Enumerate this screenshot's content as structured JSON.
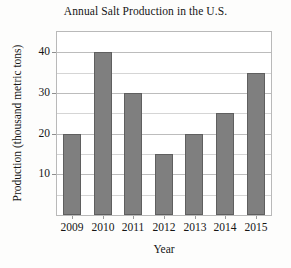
{
  "chart_data": {
    "type": "bar",
    "title": "Annual Salt Production in the U.S.",
    "xlabel": "Year",
    "ylabel": "Production (thousand metric tons)",
    "categories": [
      "2009",
      "2010",
      "2011",
      "2012",
      "2013",
      "2014",
      "2015"
    ],
    "values": [
      20,
      40,
      30,
      15,
      20,
      25,
      35
    ],
    "ylim": [
      0,
      45
    ],
    "ytick_labels": [
      "10",
      "20",
      "30",
      "40"
    ],
    "ytick_values": [
      10,
      20,
      30,
      40
    ],
    "minor_tick_step": 5,
    "grid": true,
    "legend": false,
    "bar_color": "#7f7f7f",
    "bar_edge_color": "#5f5f5f",
    "plot_border_color": "#b9b9b9",
    "gridline_color": "#d5d5d5",
    "background_color": "#ffffff"
  }
}
